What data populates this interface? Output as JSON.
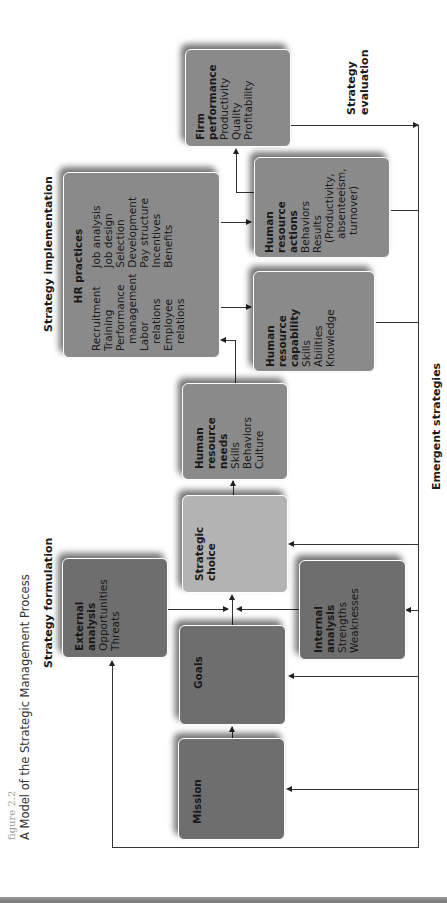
{
  "figure": {
    "number_label": "figure 2.2",
    "title": "A Model of the Strategic Management Process"
  },
  "section_labels": {
    "formulation": "Strategy formulation",
    "implementation": "Strategy implementation",
    "evaluation_line1": "Strategy",
    "evaluation_line2": "evaluation",
    "emergent": "Emergent strategies"
  },
  "boxes": {
    "mission": {
      "title": "Mission"
    },
    "goals": {
      "title": "Goals"
    },
    "external": {
      "title_line1": "External",
      "title_line2": "analysis",
      "items": [
        "Opportunities",
        "Threats"
      ]
    },
    "internal": {
      "title_line1": "Internal",
      "title_line2": "analysis",
      "items": [
        "Strengths",
        "Weaknesses"
      ]
    },
    "strategic_choice": {
      "title_line1": "Strategic",
      "title_line2": "choice"
    },
    "hr_needs": {
      "title_line1": "Human",
      "title_line2": "resource",
      "title_line3": "needs",
      "items": [
        "Skills",
        "Behaviors",
        "Culture"
      ]
    },
    "hr_practices": {
      "title": "HR practices",
      "col1": [
        "Recruitment",
        "Training",
        "Performance",
        "  management",
        "Labor",
        "  relations",
        "Employee",
        "  relations"
      ],
      "col2": [
        "Job analysis",
        "Job design",
        "Selection",
        "Development",
        "Pay structure",
        "Incentives",
        "Benefits"
      ]
    },
    "hr_capability": {
      "title_line1": "Human",
      "title_line2": "resource",
      "title_line3": "capability",
      "items": [
        "Skills",
        "Abilities",
        "Knowledge"
      ]
    },
    "hr_actions": {
      "title_line1": "Human",
      "title_line2": "resource",
      "title_line3": "actions",
      "items": [
        "Behaviors",
        "Results",
        "  (Productivity,",
        "  absenteeism,",
        "  turnover)"
      ]
    },
    "firm_performance": {
      "title_line1": "Firm",
      "title_line2": "performance",
      "items": [
        "Productivity",
        "Quality",
        "Profitability"
      ]
    }
  },
  "colors": {
    "dark_box": "#6e6e6e",
    "mid_box": "#8a8a8a",
    "light_box": "#b3b3b3",
    "line": "#333333"
  }
}
